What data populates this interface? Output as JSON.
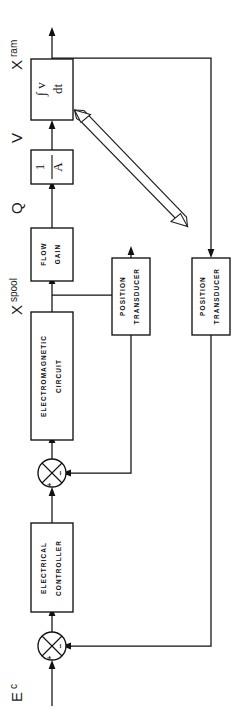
{
  "diagram": {
    "orientation": "rotated-90-ccw",
    "ink_color": "#111111",
    "background_color": "#ffffff",
    "blocks": [
      {
        "id": "integrator",
        "lines": [
          "∫ v",
          "dt"
        ],
        "kind": "math"
      },
      {
        "id": "area-gain",
        "lines": [
          "1",
          "A"
        ],
        "kind": "fraction"
      },
      {
        "id": "flow-gain",
        "lines": [
          "FLOW",
          "GAIN"
        ],
        "kind": "text"
      },
      {
        "id": "electromagnetic-circuit",
        "lines": [
          "ELECTROMAGNETIC",
          "CIRCUIT"
        ],
        "kind": "text"
      },
      {
        "id": "position-transducer-inner",
        "lines": [
          "POSITION",
          "TRANSDUCER"
        ],
        "kind": "text"
      },
      {
        "id": "position-transducer-outer",
        "lines": [
          "POSITION",
          "TRANSDUCER"
        ],
        "kind": "text"
      },
      {
        "id": "electrical-controller",
        "lines": [
          "ELECTRICAL",
          "CONTROLLER"
        ],
        "kind": "text"
      }
    ],
    "signal_labels": [
      {
        "id": "x-ram",
        "base": "X",
        "sub": "ram"
      },
      {
        "id": "velocity",
        "base": "V",
        "sub": ""
      },
      {
        "id": "flow",
        "base": "Q",
        "sub": ""
      },
      {
        "id": "x-spool",
        "base": "X",
        "sub": "spool"
      },
      {
        "id": "command-voltage",
        "base": "E",
        "sub": "c"
      }
    ],
    "summing_junctions": [
      {
        "id": "inner-summing-junction",
        "plus": "+",
        "minus": "−"
      },
      {
        "id": "outer-summing-junction",
        "plus": "+",
        "minus": "−"
      }
    ],
    "annotation_arrow": {
      "id": "pointer-arrow",
      "style": "double-line hollow arrow with heads at both ends"
    }
  }
}
